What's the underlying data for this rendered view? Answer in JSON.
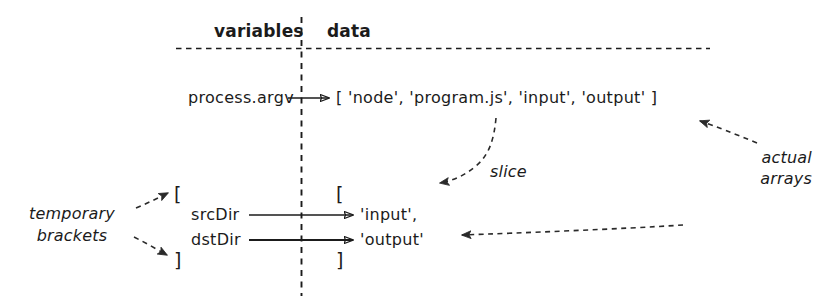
{
  "diagram": {
    "columns": {
      "variables_label": "variables",
      "data_label": "data"
    },
    "rows": {
      "argv": {
        "variable": "process.argv",
        "value": "[ 'node', 'program.js',  'input', 'output' ]"
      },
      "open_bracket_vars": "[",
      "close_bracket_vars": "]",
      "open_bracket_data": "[",
      "close_bracket_data": "]",
      "src": {
        "variable": "srcDir",
        "value": "'input',"
      },
      "dst": {
        "variable": "dstDir",
        "value": "'output'"
      }
    },
    "annotations": {
      "slice": "slice",
      "actual_arrays_line1": "actual",
      "actual_arrays_line2": "arrays",
      "temporary_brackets_line1": "temporary",
      "temporary_brackets_line2": "brackets"
    },
    "colors": {
      "ink": "#1b1b1b",
      "background": "#ffffff"
    }
  }
}
